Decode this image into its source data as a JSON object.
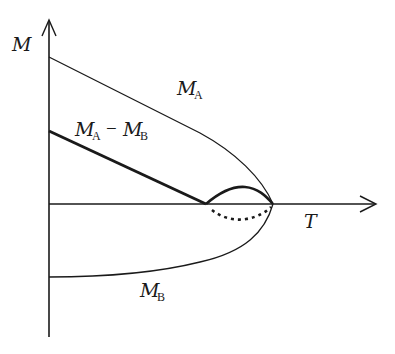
{
  "diagram": {
    "type": "magnetization vs temperature (ferrimagnet sublattices)",
    "axes": {
      "y_label": "M",
      "x_label": "T"
    },
    "curves": [
      {
        "id": "MA",
        "label_main": "M",
        "label_sub": "A",
        "style": "thin solid"
      },
      {
        "id": "MA_minus_MB",
        "label_main": "M",
        "label_sub": "A",
        "operator": "−",
        "label_main2": "M",
        "label_sub2": "B",
        "style": "thick solid, plus dotted branch below axis"
      },
      {
        "id": "MB",
        "label_main": "M",
        "label_sub": "B",
        "style": "thin solid (negative)"
      }
    ],
    "colors": {
      "ink": "#1a1a1a",
      "background": "#ffffff"
    }
  }
}
